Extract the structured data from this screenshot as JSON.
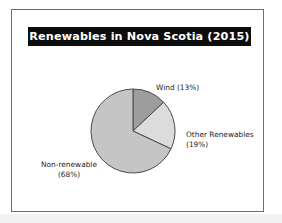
{
  "figure": {
    "title": "Renewables in Nova Scotia (2015)",
    "title_background": "#0d0d0d",
    "title_color": "#ffffff",
    "frame_color": "#6e6e6e",
    "background": "#ffffff"
  },
  "labels": {
    "wind": "Wind (13%)",
    "other_name": "Other Renewables",
    "other_pct": "(19%)",
    "nonrenewable_name": "Non-renewable",
    "nonrenewable_pct": "(68%)"
  },
  "chart_data": {
    "type": "pie",
    "title": "Renewables in Nova Scotia (2015)",
    "xlabel": "",
    "ylabel": "",
    "legend_position": "none",
    "grid": false,
    "start_angle_deg": 0,
    "direction": "clockwise",
    "categories": [
      "Wind",
      "Other Renewables",
      "Non-renewable"
    ],
    "values": [
      13,
      19,
      68
    ],
    "unit": "%",
    "slices": [
      {
        "label": "Wind",
        "value": 13,
        "display": "Wind (13%)",
        "color": "#9d9d9d",
        "edge_color": "#4a4a4a"
      },
      {
        "label": "Other Renewables",
        "value": 19,
        "display": "Other Renewables (19%)",
        "color": "#dcdcdc",
        "edge_color": "#4a4a4a"
      },
      {
        "label": "Non-renewable",
        "value": 68,
        "display": "Non-renewable (68%)",
        "color": "#c5c5c5",
        "edge_color": "#4a4a4a"
      }
    ]
  }
}
